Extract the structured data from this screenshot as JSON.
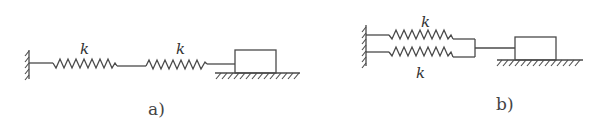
{
  "diagrams": [
    {
      "id": "a",
      "caption": "a)",
      "configuration": "series",
      "springs": [
        {
          "label": "k",
          "position": "left"
        },
        {
          "label": "k",
          "position": "right"
        }
      ],
      "components": [
        "fixed-wall",
        "spring",
        "spring",
        "mass-block",
        "ground"
      ]
    },
    {
      "id": "b",
      "caption": "b)",
      "configuration": "parallel",
      "springs": [
        {
          "label": "k",
          "position": "top"
        },
        {
          "label": "k",
          "position": "bottom"
        }
      ],
      "components": [
        "fixed-wall",
        "spring",
        "spring",
        "connecting-bar",
        "mass-block",
        "ground"
      ]
    }
  ],
  "colors": {
    "line": "#4a4a4a",
    "background": "#ffffff"
  }
}
